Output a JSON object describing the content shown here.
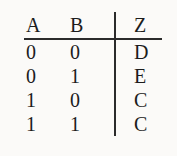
{
  "table": {
    "headers": [
      "A",
      "B",
      "Z"
    ],
    "rows": [
      [
        "0",
        "0",
        "D"
      ],
      [
        "0",
        "1",
        "E"
      ],
      [
        "1",
        "0",
        "C"
      ],
      [
        "1",
        "1",
        "C"
      ]
    ]
  },
  "chart_data": {
    "type": "table",
    "columns": [
      "A",
      "B",
      "Z"
    ],
    "rows": [
      [
        "0",
        "0",
        "D"
      ],
      [
        "0",
        "1",
        "E"
      ],
      [
        "1",
        "0",
        "C"
      ],
      [
        "1",
        "1",
        "C"
      ]
    ]
  },
  "colors": {
    "text": "#1c1c1c",
    "rule": "#2b2b2b",
    "background": "#fbfaf8"
  }
}
